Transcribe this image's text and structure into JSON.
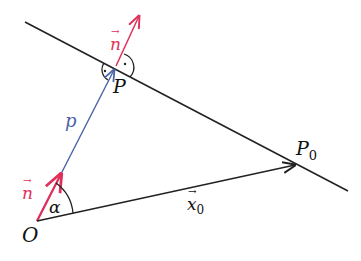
{
  "diagram": {
    "colors": {
      "line": "#222222",
      "normal": "#e0305a",
      "position": "#4a62a8",
      "text": "#111111"
    },
    "labels": {
      "normal_top": "n",
      "normal_bottom": "n",
      "point_P": "P",
      "point_P0": "P",
      "point_P0_sub": "0",
      "origin": "O",
      "distance_p": "p",
      "angle": "α",
      "vector_x0": "x",
      "vector_x0_sub": "0",
      "vec_arrow": "→",
      "right_angle_dot": "·"
    }
  }
}
